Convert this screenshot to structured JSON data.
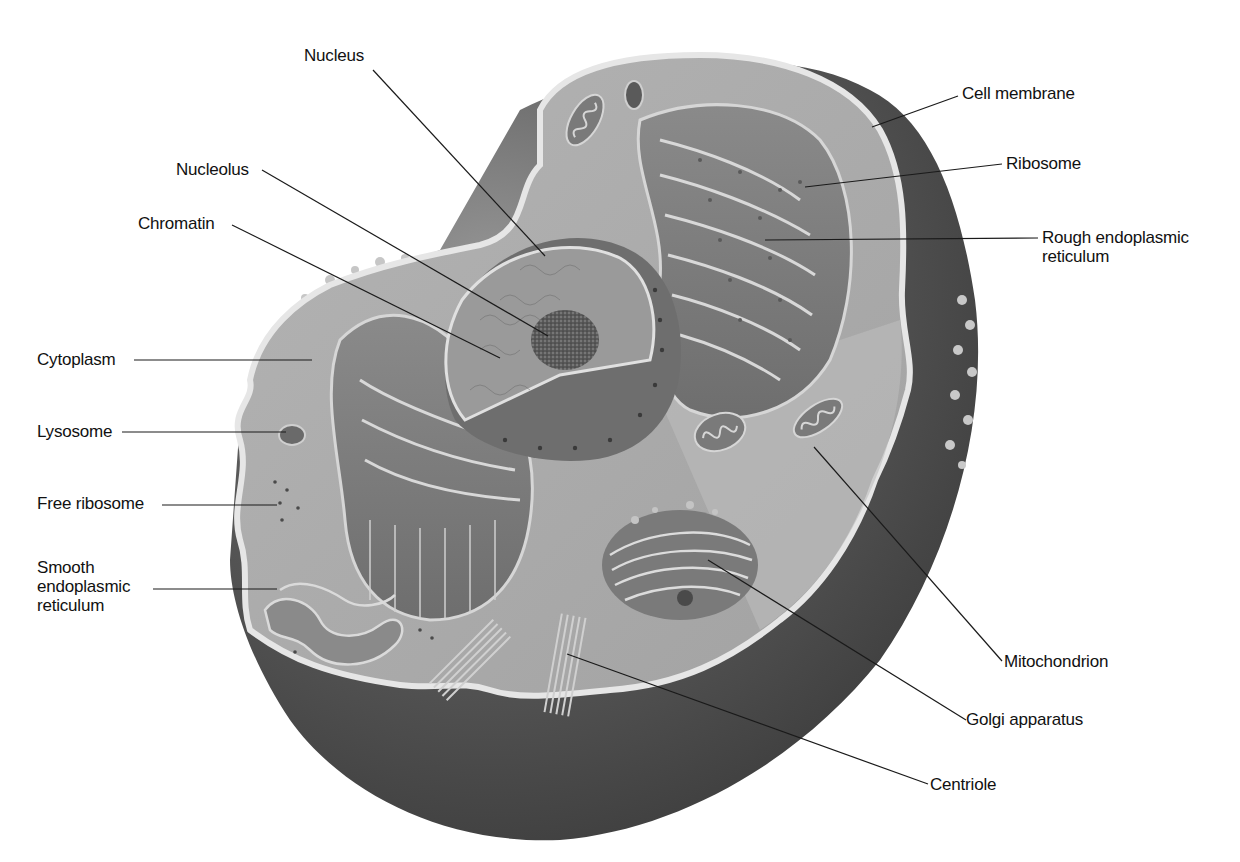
{
  "diagram": {
    "colors": {
      "background": "#ffffff",
      "cytoplasm": "#a9a9a9",
      "cytoplasm_light": "#b8b8b8",
      "membrane": "#e4e4e4",
      "outer_shell": "#4a4a4a",
      "nucleus": "#8e8e8e",
      "nucleolus": "#505050",
      "label_text": "#111111",
      "leader_line": "#1a1a1a"
    },
    "labels": {
      "nucleus": "Nucleus",
      "nucleolus": "Nucleolus",
      "chromatin": "Chromatin",
      "cytoplasm": "Cytoplasm",
      "lysosome": "Lysosome",
      "free_ribosome": "Free ribosome",
      "smooth_er": "Smooth\nendoplasmic\nreticulum",
      "cell_membrane": "Cell membrane",
      "ribosome": "Ribosome",
      "rough_er": "Rough endoplasmic\nreticulum",
      "mitochondrion": "Mitochondrion",
      "golgi": "Golgi apparatus",
      "centriole": "Centriole"
    }
  }
}
